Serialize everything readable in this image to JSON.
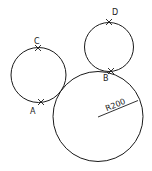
{
  "diagram": {
    "type": "geometry-tangent-circles",
    "circles": [
      {
        "id": "left",
        "cx": 38.5,
        "cy": 75,
        "r": 27.5
      },
      {
        "id": "top-right",
        "cx": 109,
        "cy": 47,
        "r": 24.5
      },
      {
        "id": "large",
        "cx": 98,
        "cy": 116.5,
        "r": 45
      }
    ],
    "points": [
      {
        "label": "A",
        "x": 41,
        "y": 102,
        "lx": 30,
        "ly": 114
      },
      {
        "label": "B",
        "x": 111,
        "y": 71,
        "lx": 103,
        "ly": 81
      },
      {
        "label": "C",
        "x": 38,
        "y": 48,
        "lx": 34,
        "ly": 44
      },
      {
        "label": "D",
        "x": 109,
        "y": 22,
        "lx": 112,
        "ly": 15
      }
    ],
    "dimension": {
      "text": "R200",
      "x1": 98,
      "y1": 117,
      "x2": 138,
      "y2": 100.5
    }
  }
}
